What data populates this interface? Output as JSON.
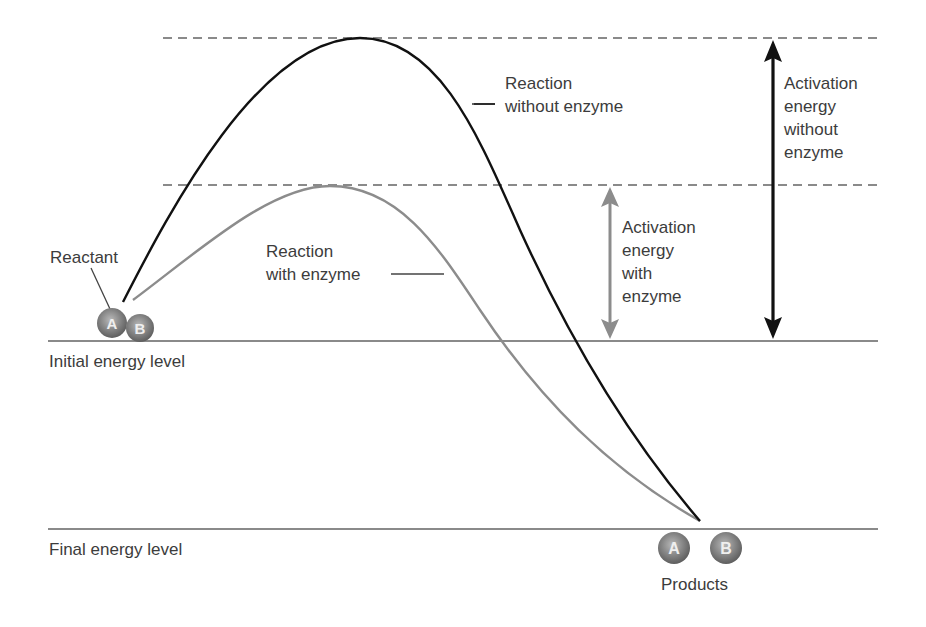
{
  "diagram": {
    "levels": {
      "initial": "Initial energy level",
      "final": "Final energy level"
    },
    "curves": {
      "without_enzyme": {
        "line1": "Reaction",
        "line2": "without enzyme",
        "color": "#111111"
      },
      "with_enzyme": {
        "line1": "Reaction",
        "line2": "with enzyme",
        "color": "#8c8c8c"
      }
    },
    "activation": {
      "without_enzyme": {
        "lines": [
          "Activation",
          "energy",
          "without",
          "enzyme"
        ],
        "color": "#111111"
      },
      "with_enzyme": {
        "lines": [
          "Activation",
          "energy",
          "with",
          "enzyme"
        ],
        "color": "#8c8c8c"
      }
    },
    "reactant": {
      "label": "Reactant",
      "molecules": [
        "A",
        "B"
      ]
    },
    "products": {
      "label": "Products",
      "molecules": [
        "A",
        "B"
      ]
    },
    "colors": {
      "level_line": "#8a8a8a",
      "dashed_line": "#8a8a8a",
      "molecule": "#7a7a7a",
      "text": "#3c3c3c"
    }
  }
}
